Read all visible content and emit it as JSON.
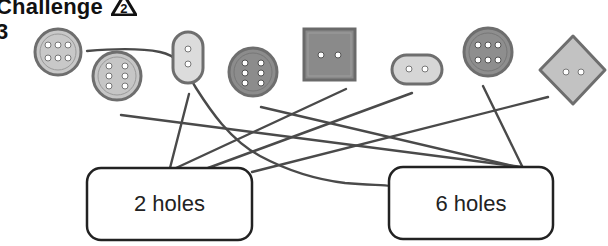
{
  "header": {
    "title": "Challenge",
    "level_badge": "2",
    "question_label": "3"
  },
  "buttons": [
    {
      "id": "b1",
      "shape": "circle",
      "holes": 6,
      "shade": "light"
    },
    {
      "id": "b2",
      "shape": "circle",
      "holes": 6,
      "shade": "light"
    },
    {
      "id": "b3",
      "shape": "oval-vertical",
      "holes": 2,
      "shade": "light"
    },
    {
      "id": "b4",
      "shape": "circle",
      "holes": 6,
      "shade": "dark"
    },
    {
      "id": "b5",
      "shape": "square",
      "holes": 2,
      "shade": "dark"
    },
    {
      "id": "b6",
      "shape": "oval-horizontal",
      "holes": 2,
      "shade": "light"
    },
    {
      "id": "b7",
      "shape": "circle",
      "holes": 6,
      "shade": "dark"
    },
    {
      "id": "b8",
      "shape": "diamond",
      "holes": 2,
      "shade": "light"
    }
  ],
  "boxes": [
    {
      "id": "two",
      "label": "2 holes"
    },
    {
      "id": "six",
      "label": "6 holes"
    }
  ],
  "connections": [
    {
      "from": "b1",
      "to": "six"
    },
    {
      "from": "b2",
      "to": "six"
    },
    {
      "from": "b3",
      "to": "two"
    },
    {
      "from": "b4",
      "to": "six"
    },
    {
      "from": "b5",
      "to": "two"
    },
    {
      "from": "b6",
      "to": "two"
    },
    {
      "from": "b7",
      "to": "six"
    },
    {
      "from": "b8",
      "to": "two"
    }
  ],
  "colors": {
    "line": "#4a4a4a",
    "button_light": "#c8c8c8",
    "button_dark": "#8a8a8a",
    "button_rim": "#6e6e6e"
  }
}
